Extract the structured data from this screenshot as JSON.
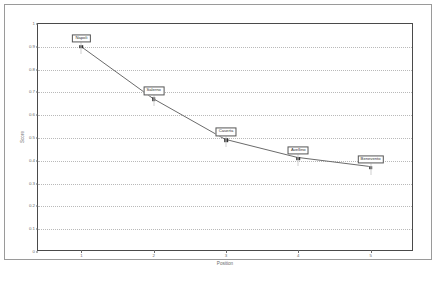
{
  "chart_data": {
    "type": "line",
    "title": "",
    "xlabel": "Position",
    "ylabel": "Score",
    "xlim": [
      0.4,
      5.6
    ],
    "ylim": [
      0,
      1
    ],
    "grid": true,
    "legend": false,
    "x": [
      1,
      2,
      3,
      4,
      5
    ],
    "categories": [
      "Napoli",
      "Salerno",
      "Caserta",
      "Avellino",
      "Benevento"
    ],
    "values": [
      0.9,
      0.67,
      0.49,
      0.41,
      0.37
    ],
    "series": [
      {
        "name": "Score",
        "values": [
          0.9,
          0.67,
          0.49,
          0.41,
          0.37
        ]
      }
    ],
    "point_labels": [
      "Napoli",
      "Salerno",
      "Caserta",
      "Avellino",
      "Benevento"
    ],
    "yticks": [
      "0",
      "0.1",
      "0.2",
      "0.3",
      "0.4",
      "0.5",
      "0.6",
      "0.7",
      "0.8",
      "0.9",
      "1"
    ],
    "ytick_values": [
      0,
      0.1,
      0.2,
      0.3,
      0.4,
      0.5,
      0.6,
      0.7,
      0.8,
      0.9,
      1
    ],
    "xticks": [
      "1",
      "2",
      "3",
      "4",
      "5"
    ],
    "xtick_values": [
      1,
      2,
      3,
      4,
      5
    ],
    "colors": {
      "line": "#6b6b6b",
      "marker": "#2f2f2f",
      "grid": "#b9b9b9",
      "axis": "#4a4a4a",
      "text": "#6a6a6a",
      "label_box_border": "#555555",
      "label_box_fill": "#ffffff",
      "background": "#ffffff"
    }
  }
}
